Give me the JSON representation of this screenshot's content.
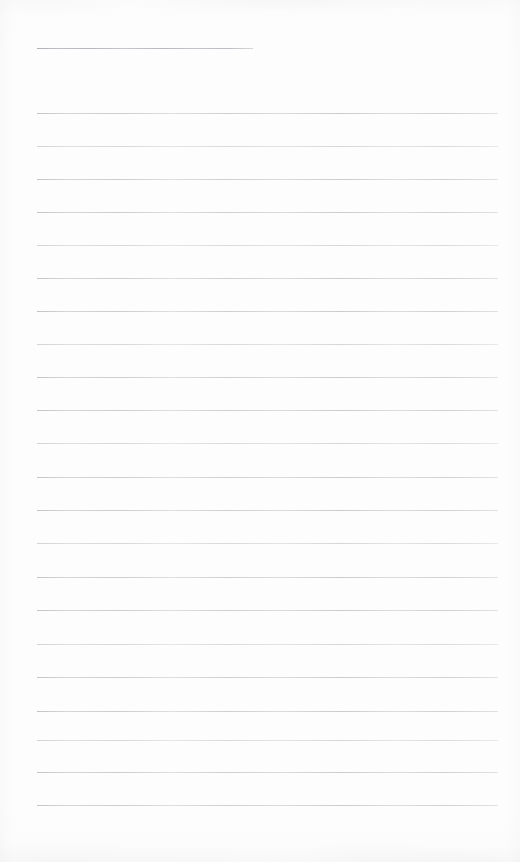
{
  "document": {
    "kind": "scanned-lined-paper",
    "title_text": "",
    "body_text": "",
    "page_width": 520,
    "page_height": 862,
    "page_background_color": "#fdfdfd",
    "rule_color": "#d9d9db",
    "title_rule_color": "#b4b4ba",
    "rule_thickness_px": 1,
    "rule_left_x": 37,
    "rule_right_x": 498,
    "rule_spacing_px": 33.2,
    "total_rule_count": 23,
    "has_margin_line": false,
    "has_page_number": false,
    "has_header": false,
    "has_footer": false
  },
  "title_rule": {
    "name": "title-rule",
    "y": 48,
    "x": 37,
    "width": 216,
    "label": ""
  },
  "body_rules": [
    {
      "y": 113,
      "x": 37,
      "width": 461,
      "label": ""
    },
    {
      "y": 146,
      "x": 37,
      "width": 461,
      "label": ""
    },
    {
      "y": 179,
      "x": 37,
      "width": 461,
      "label": ""
    },
    {
      "y": 212,
      "x": 37,
      "width": 461,
      "label": ""
    },
    {
      "y": 245,
      "x": 37,
      "width": 461,
      "label": ""
    },
    {
      "y": 278,
      "x": 37,
      "width": 461,
      "label": ""
    },
    {
      "y": 311,
      "x": 37,
      "width": 461,
      "label": ""
    },
    {
      "y": 344,
      "x": 37,
      "width": 461,
      "label": ""
    },
    {
      "y": 377,
      "x": 37,
      "width": 461,
      "label": ""
    },
    {
      "y": 410,
      "x": 37,
      "width": 461,
      "label": ""
    },
    {
      "y": 443,
      "x": 37,
      "width": 461,
      "label": ""
    },
    {
      "y": 477,
      "x": 37,
      "width": 461,
      "label": ""
    },
    {
      "y": 510,
      "x": 37,
      "width": 461,
      "label": ""
    },
    {
      "y": 543,
      "x": 37,
      "width": 461,
      "label": ""
    },
    {
      "y": 577,
      "x": 37,
      "width": 461,
      "label": ""
    },
    {
      "y": 610,
      "x": 37,
      "width": 461,
      "label": ""
    },
    {
      "y": 644,
      "x": 37,
      "width": 461,
      "label": ""
    },
    {
      "y": 677,
      "x": 37,
      "width": 461,
      "label": ""
    },
    {
      "y": 711,
      "x": 37,
      "width": 461,
      "label": ""
    },
    {
      "y": 740,
      "x": 37,
      "width": 461,
      "label": ""
    },
    {
      "y": 772,
      "x": 37,
      "width": 461,
      "label": ""
    },
    {
      "y": 805,
      "x": 37,
      "width": 461,
      "label": ""
    }
  ]
}
